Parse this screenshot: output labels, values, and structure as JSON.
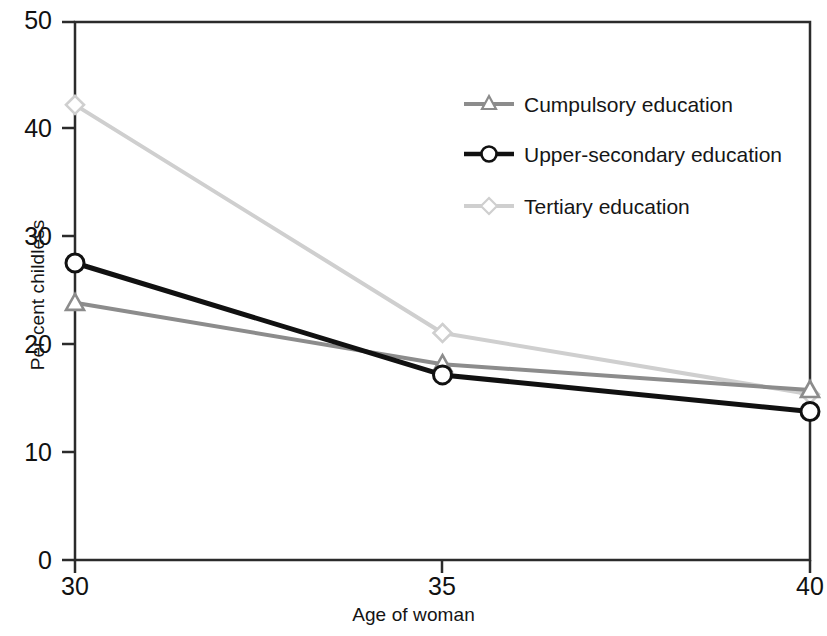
{
  "chart_data": {
    "type": "line",
    "title": "",
    "xlabel": "Age of woman",
    "ylabel": "Per cent childless",
    "x": [
      30,
      35,
      40
    ],
    "xticklabels": [
      "30",
      "35",
      "40"
    ],
    "yticklabels": [
      "0",
      "10",
      "20",
      "30",
      "40",
      "50"
    ],
    "yticks": [
      0,
      10,
      20,
      30,
      40,
      50
    ],
    "xlim": [
      30,
      40
    ],
    "ylim": [
      0,
      50
    ],
    "grid": false,
    "legend_position": "upper right",
    "series": [
      {
        "name": "Cumpulsory education",
        "values": [
          23.9,
          18.2,
          15.8
        ],
        "color": "#8c8c8c",
        "marker": "triangle"
      },
      {
        "name": "Upper-secondary education",
        "values": [
          27.6,
          17.2,
          13.8
        ],
        "color": "#111111",
        "marker": "circle"
      },
      {
        "name": "Tertiary education",
        "values": [
          42.3,
          21.1,
          15.4
        ],
        "color": "#cfcfcf",
        "marker": "diamond"
      }
    ]
  },
  "axes": {
    "ylabel": "Per cent childless",
    "xlabel": "Age of woman",
    "ytick_0": "0",
    "ytick_10": "10",
    "ytick_20": "20",
    "ytick_30": "30",
    "ytick_40": "40",
    "ytick_50": "50",
    "xtick_30": "30",
    "xtick_35": "35",
    "xtick_40": "40"
  },
  "legend": {
    "items": [
      {
        "label": "Cumpulsory education"
      },
      {
        "label": "Upper-secondary education"
      },
      {
        "label": "Tertiary education"
      }
    ]
  },
  "colors": {
    "compulsory": "#8c8c8c",
    "upper_secondary": "#111111",
    "tertiary": "#cfcfcf",
    "frame": "#2b2b2b"
  }
}
